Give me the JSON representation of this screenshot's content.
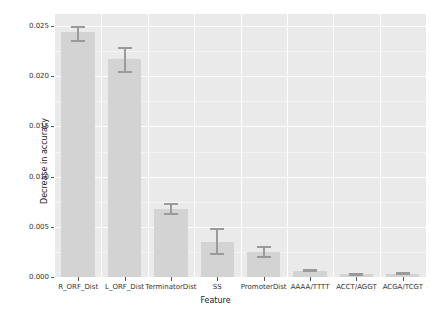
{
  "chart_data": {
    "type": "bar",
    "title": "",
    "xlabel": "Feature",
    "ylabel": "Decrease in accuracy",
    "categories": [
      "R_ORF_Dist",
      "L_ORF_Dist",
      "TerminatorDist",
      "SS",
      "PromoterDist",
      "AAAA/TTTT",
      "ACCT/AGGT",
      "ACGA/TCGT"
    ],
    "values": [
      0.0244,
      0.0217,
      0.0068,
      0.0035,
      0.0025,
      0.0006,
      0.0003,
      0.00035
    ],
    "error_low": [
      0.0234,
      0.0203,
      0.0062,
      0.0022,
      0.0019,
      0.00045,
      0.00022,
      0.00025
    ],
    "error_high": [
      0.025,
      0.0229,
      0.0074,
      0.0049,
      0.0031,
      0.00075,
      0.0004,
      0.00048
    ],
    "ylim": [
      0.0,
      0.0262
    ],
    "xlim": [
      0,
      8
    ],
    "yticks": [
      0.0,
      0.005,
      0.01,
      0.015,
      0.02,
      0.025
    ],
    "ytick_labels": [
      "0.000",
      "0.005",
      "0.010",
      "0.015",
      "0.020",
      "0.025"
    ],
    "grid": true,
    "legend": null,
    "colors": {
      "panel_background": "#eaeaea",
      "grid_major": "#ffffff",
      "bar_fill": "#d3d3d3",
      "error_bar": "#9a9a9a",
      "text": "#333333",
      "figure_background": "#ffffff"
    }
  }
}
